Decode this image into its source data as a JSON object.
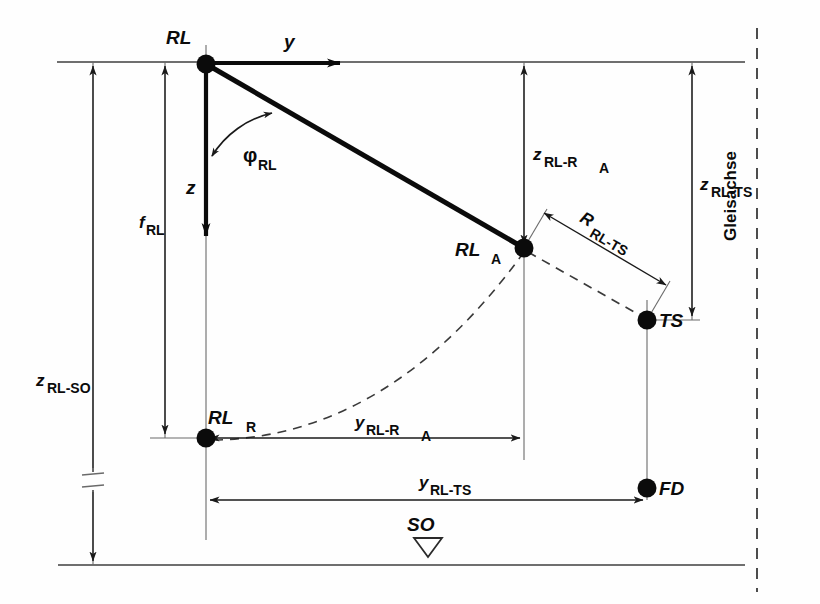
{
  "diagram": {
    "title_vertical_right": "Gleisachse",
    "points": [
      {
        "id": "RL",
        "label": "RL",
        "sub": "",
        "x": 206,
        "y": 64
      },
      {
        "id": "RL_A",
        "label": "RL",
        "sub": "A",
        "x": 524,
        "y": 248
      },
      {
        "id": "RL_R",
        "label": "RL",
        "sub": "R",
        "x": 206,
        "y": 438
      },
      {
        "id": "TS",
        "label": "TS",
        "sub": "",
        "x": 647,
        "y": 320
      },
      {
        "id": "FD",
        "label": "FD",
        "sub": "",
        "x": 647,
        "y": 488
      }
    ],
    "axes": [
      {
        "id": "y-axis",
        "label": "y",
        "sub": "",
        "from": [
          206,
          64
        ],
        "to": [
          355,
          64
        ]
      },
      {
        "id": "z-axis",
        "label": "z",
        "sub": "",
        "from": [
          206,
          64
        ],
        "to": [
          206,
          250
        ]
      }
    ],
    "angle": {
      "id": "phi-rl",
      "glyph": "φ",
      "sub": "RL"
    },
    "dimensions": [
      {
        "id": "z-rl-so",
        "base": "z",
        "sub": "RL-SO",
        "orientation": "vertical"
      },
      {
        "id": "f-rl",
        "base": "f",
        "sub": "RL",
        "orientation": "vertical"
      },
      {
        "id": "z-rl-ra",
        "base": "z",
        "sub": "RL-R",
        "sub2": "A",
        "orientation": "vertical"
      },
      {
        "id": "z-rl-ts",
        "base": "z",
        "sub": "RL-TS",
        "orientation": "vertical"
      },
      {
        "id": "y-rl-ra",
        "base": "y",
        "sub": "RL-R",
        "sub2": "A",
        "orientation": "horizontal"
      },
      {
        "id": "y-rl-ts",
        "base": "y",
        "sub": "RL-TS",
        "orientation": "horizontal"
      },
      {
        "id": "r-rl-ts",
        "base": "R",
        "sub": "RL-TS",
        "orientation": "oblique"
      }
    ],
    "datum": {
      "id": "so",
      "label": "SO",
      "symbol": "benchmark-triangle"
    },
    "colors": {
      "ink": "#0b0b0b",
      "thin_line": "#4a4a4a",
      "background": "#fefefe",
      "dash": "#3a3a3a"
    }
  }
}
